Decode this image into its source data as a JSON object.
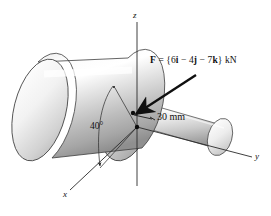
{
  "figure": {
    "background_color": "#ffffff",
    "line_color": "#1a1a1a",
    "metal_light": "#fdfdfd",
    "metal_mid": "#c9c9c9",
    "metal_dark": "#9a9a9a"
  },
  "axes": {
    "z_label": "z",
    "y_label": "y",
    "x_label": "x"
  },
  "annotations": {
    "force_prefix": "F",
    "force_equals": " = {6",
    "force_i": "i",
    "force_minus1": " − 4",
    "force_j": "j",
    "force_minus2": " − 7",
    "force_k": "k",
    "force_suffix": "} kN",
    "force_full": "F = {6i − 4j − 7k} kN",
    "angle": "40°",
    "radius_dimension": "30 mm"
  }
}
